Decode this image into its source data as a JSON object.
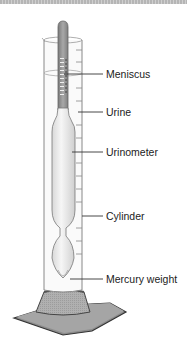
{
  "diagram": {
    "labels": [
      {
        "id": "meniscus",
        "text": "Meniscus"
      },
      {
        "id": "urine",
        "text": "Urine"
      },
      {
        "id": "urinometer",
        "text": "Urinometer"
      },
      {
        "id": "cylinder",
        "text": "Cylinder"
      },
      {
        "id": "mercury-weight",
        "text": "Mercury weight"
      }
    ],
    "colors": {
      "stem_dark": "#8a8a8a",
      "glass": "#f2f2f2",
      "base": "#9a9a9a",
      "plate": "#6e6e6e",
      "line": "#333333"
    }
  }
}
